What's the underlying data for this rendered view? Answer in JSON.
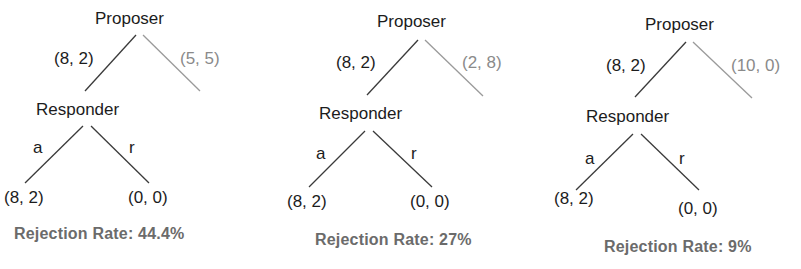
{
  "figure": {
    "colors": {
      "main_text": "#1c1c1c",
      "alt_branch": "#8a8a8a",
      "main_line": "#3a3a3a",
      "rate_text": "#6b6b6b"
    }
  },
  "trees": [
    {
      "proposer_label": "Proposer",
      "offer_main": "(8, 2)",
      "offer_alt": "(5, 5)",
      "responder_label": "Responder",
      "accept_label": "a",
      "reject_label": "r",
      "accept_payoff": "(8, 2)",
      "reject_payoff": "(0, 0)",
      "rejection_rate": "Rejection Rate: 44.4%"
    },
    {
      "proposer_label": "Proposer",
      "offer_main": "(8, 2)",
      "offer_alt": "(2, 8)",
      "responder_label": "Responder",
      "accept_label": "a",
      "reject_label": "r",
      "accept_payoff": "(8, 2)",
      "reject_payoff": "(0, 0)",
      "rejection_rate": "Rejection Rate: 27%"
    },
    {
      "proposer_label": "Proposer",
      "offer_main": "(8, 2)",
      "offer_alt": "(10, 0)",
      "responder_label": "Responder",
      "accept_label": "a",
      "reject_label": "r",
      "accept_payoff": "(8, 2)",
      "reject_payoff": "(0, 0)",
      "rejection_rate": "Rejection Rate: 9%"
    }
  ]
}
